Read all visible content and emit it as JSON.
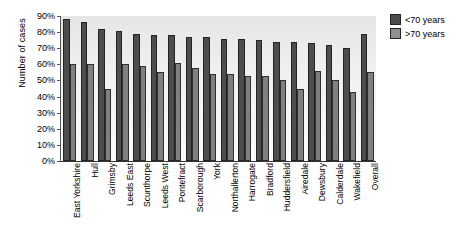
{
  "chart_data": {
    "type": "bar",
    "title": "",
    "subtitle": "",
    "xlabel": "",
    "ylabel": "Number of cases",
    "ylim": [
      0,
      90
    ],
    "ytick_step": 10,
    "grid": false,
    "legend_position": "right",
    "categories": [
      "East Yorkshire",
      "Hull",
      "Grimsby",
      "Leeds East",
      "Scunthorpe",
      "Leeds West",
      "Pontefract",
      "Scarborough",
      "York",
      "Northallerton",
      "Harrogate",
      "Bradford",
      "Huddersfield",
      "Airedale",
      "Dewsbury",
      "Calderdale",
      "Wakefield",
      "Overall"
    ],
    "ytick_labels": [
      "0%",
      "10%",
      "20%",
      "30%",
      "40%",
      "50%",
      "60%",
      "70%",
      "80%",
      "90%"
    ],
    "ytick_values": [
      0,
      10,
      20,
      30,
      40,
      50,
      60,
      70,
      80,
      90
    ],
    "series": [
      {
        "name": "<70 years",
        "color": "#4d4d4d",
        "values": [
          88,
          86,
          82,
          81,
          79,
          78,
          78,
          77,
          77,
          76,
          76,
          75,
          74,
          74,
          73,
          72,
          70,
          79
        ]
      },
      {
        "name": ">70 years",
        "color": "#808080",
        "values": [
          60,
          60,
          45,
          60,
          59,
          55,
          61,
          58,
          54,
          54,
          53,
          53,
          50,
          45,
          56,
          50,
          43,
          55
        ]
      }
    ]
  },
  "legend": {
    "items": [
      {
        "label": "<70 years"
      },
      {
        "label": ">70 years"
      }
    ]
  },
  "axis": {
    "y_title": "Number of cases"
  }
}
